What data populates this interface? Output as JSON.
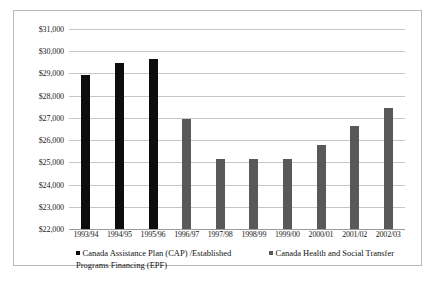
{
  "chart_data": {
    "type": "bar",
    "title": "",
    "xlabel": "",
    "ylabel": "",
    "ylim": [
      22000,
      31000
    ],
    "ytick_step": 1000,
    "grid": true,
    "legend_position": "bottom",
    "currency_prefix": "$",
    "categories": [
      "1993/94",
      "1994/95",
      "1995/96",
      "1996/97",
      "1997/98",
      "1998/99",
      "1999/00",
      "2000/01",
      "2001/02",
      "2002/03"
    ],
    "ytick_labels": [
      "$31,000",
      "$30,000",
      "$29,000",
      "$28,000",
      "$27,000",
      "$26,000",
      "$25,000",
      "$24,000",
      "$23,000",
      "$22,000"
    ],
    "ytick_values": [
      31000,
      30000,
      29000,
      28000,
      27000,
      26000,
      25000,
      24000,
      23000,
      22000
    ],
    "series": [
      {
        "name": "Canada Assistance Plan (CAP) /Established Programs Financing (EPF)",
        "color": "#0d0d0d",
        "values": [
          28950,
          29450,
          29650,
          null,
          null,
          null,
          null,
          null,
          null,
          null
        ]
      },
      {
        "name": "Canada Health and Social Transfer",
        "color": "#595959",
        "values": [
          null,
          null,
          null,
          26950,
          25150,
          25150,
          25150,
          25800,
          26650,
          27450
        ]
      }
    ]
  },
  "legend": {
    "entries": [
      {
        "label": "Canada Assistance Plan (CAP) /Established Programs Financing (EPF)",
        "color": "#0d0d0d"
      },
      {
        "label": "Canada Health and Social Transfer",
        "color": "#595959"
      }
    ]
  }
}
